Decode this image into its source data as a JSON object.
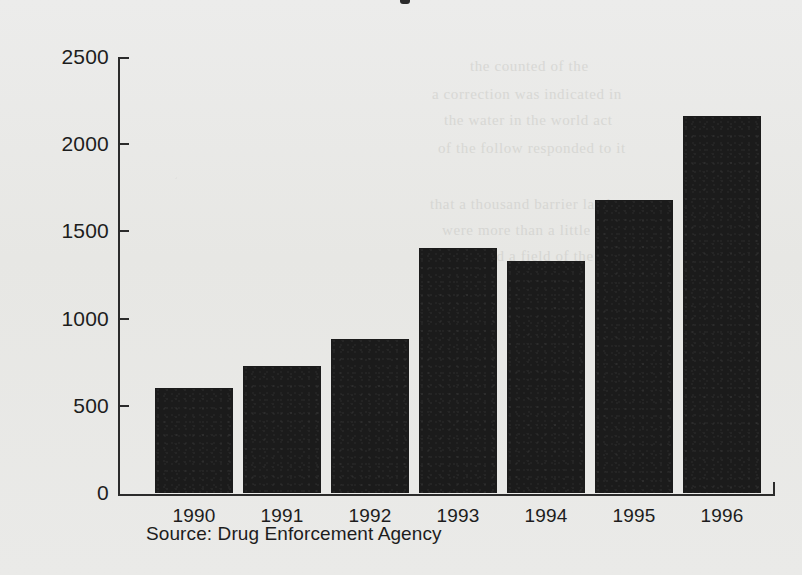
{
  "chart_data": {
    "type": "bar",
    "title": "",
    "xlabel": "",
    "ylabel": "Consumption in Grams (per 100,000 persons)",
    "categories": [
      "1990",
      "1991",
      "1992",
      "1993",
      "1994",
      "1995",
      "1996"
    ],
    "values": [
      605,
      730,
      885,
      1405,
      1330,
      1680,
      2160
    ],
    "ylim": [
      0,
      2500
    ],
    "ytick_values": [
      0,
      500,
      1000,
      1500,
      2000,
      2500
    ],
    "ytick_labels": [
      "0",
      "500",
      "1000",
      "1500",
      "2000",
      "2500"
    ],
    "grid": false,
    "legend": false,
    "legend_position": "none",
    "bar_color": "#1b1b1b",
    "axis_color": "#2b2b2b",
    "background_color": "#e9e9e7",
    "source": "Source: Drug Enforcement Agency"
  },
  "ghost_text": {
    "lines": [
      {
        "text": "the counted of the",
        "left": 470,
        "top": 58
      },
      {
        "text": "a correction was indicated in",
        "left": 432,
        "top": 86
      },
      {
        "text": "the water in the world act",
        "left": 444,
        "top": 112
      },
      {
        "text": "of the follow responded to it",
        "left": 438,
        "top": 140
      },
      {
        "text": "that a thousand barrier land",
        "left": 430,
        "top": 196
      },
      {
        "text": "were more than a little in",
        "left": 442,
        "top": 222
      },
      {
        "text": "that had a field of the",
        "left": 452,
        "top": 248
      }
    ]
  }
}
